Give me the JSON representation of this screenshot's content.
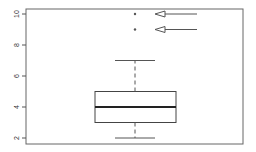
{
  "chart_data": {
    "type": "box",
    "title": "",
    "xlabel": "",
    "ylabel": "",
    "ylim": [
      1.6,
      10.4
    ],
    "yticks": [
      2,
      4,
      6,
      8,
      10
    ],
    "ytick_labels": [
      "2",
      "4",
      "6",
      "8",
      "10"
    ],
    "grid": false,
    "legend": null,
    "series": [
      {
        "name": "",
        "min_whisker": 2,
        "q1": 3,
        "median": 4,
        "q3": 5,
        "max_whisker": 7,
        "outliers": [
          9,
          10
        ]
      }
    ],
    "annotations": [
      {
        "type": "arrow",
        "points_to": "outlier",
        "value": 10
      },
      {
        "type": "arrow",
        "points_to": "outlier",
        "value": 9
      }
    ]
  },
  "colors": {
    "frame": "#555555",
    "box": "#444444",
    "median": "#222222",
    "whisker": "#555555",
    "arrow": "#555555"
  }
}
